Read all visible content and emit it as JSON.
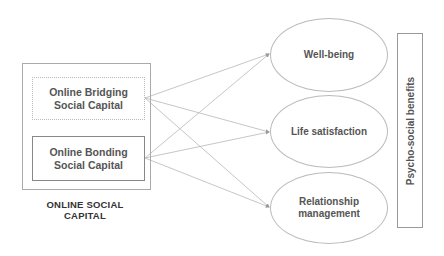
{
  "left_group": {
    "title": "ONLINE SOCIAL CAPITAL",
    "boxes": [
      {
        "label": "Online Bridging Social Capital",
        "border": "dotted"
      },
      {
        "label": "Online Bonding Social Capital",
        "border": "solid"
      }
    ]
  },
  "outcomes": [
    {
      "label": "Well-being"
    },
    {
      "label": "Life satisfaction"
    },
    {
      "label": "Relationship management"
    }
  ],
  "side_panel": {
    "label": "Psycho-social benefits"
  },
  "arrows": [
    {
      "from": "Online Bridging Social Capital",
      "to": "Well-being"
    },
    {
      "from": "Online Bridging Social Capital",
      "to": "Life satisfaction"
    },
    {
      "from": "Online Bridging Social Capital",
      "to": "Relationship management"
    },
    {
      "from": "Online Bonding Social Capital",
      "to": "Well-being"
    },
    {
      "from": "Online Bonding Social Capital",
      "to": "Life satisfaction"
    },
    {
      "from": "Online Bonding Social Capital",
      "to": "Relationship management"
    }
  ],
  "colors": {
    "line": "#b0b0b0",
    "text": "#555555"
  }
}
